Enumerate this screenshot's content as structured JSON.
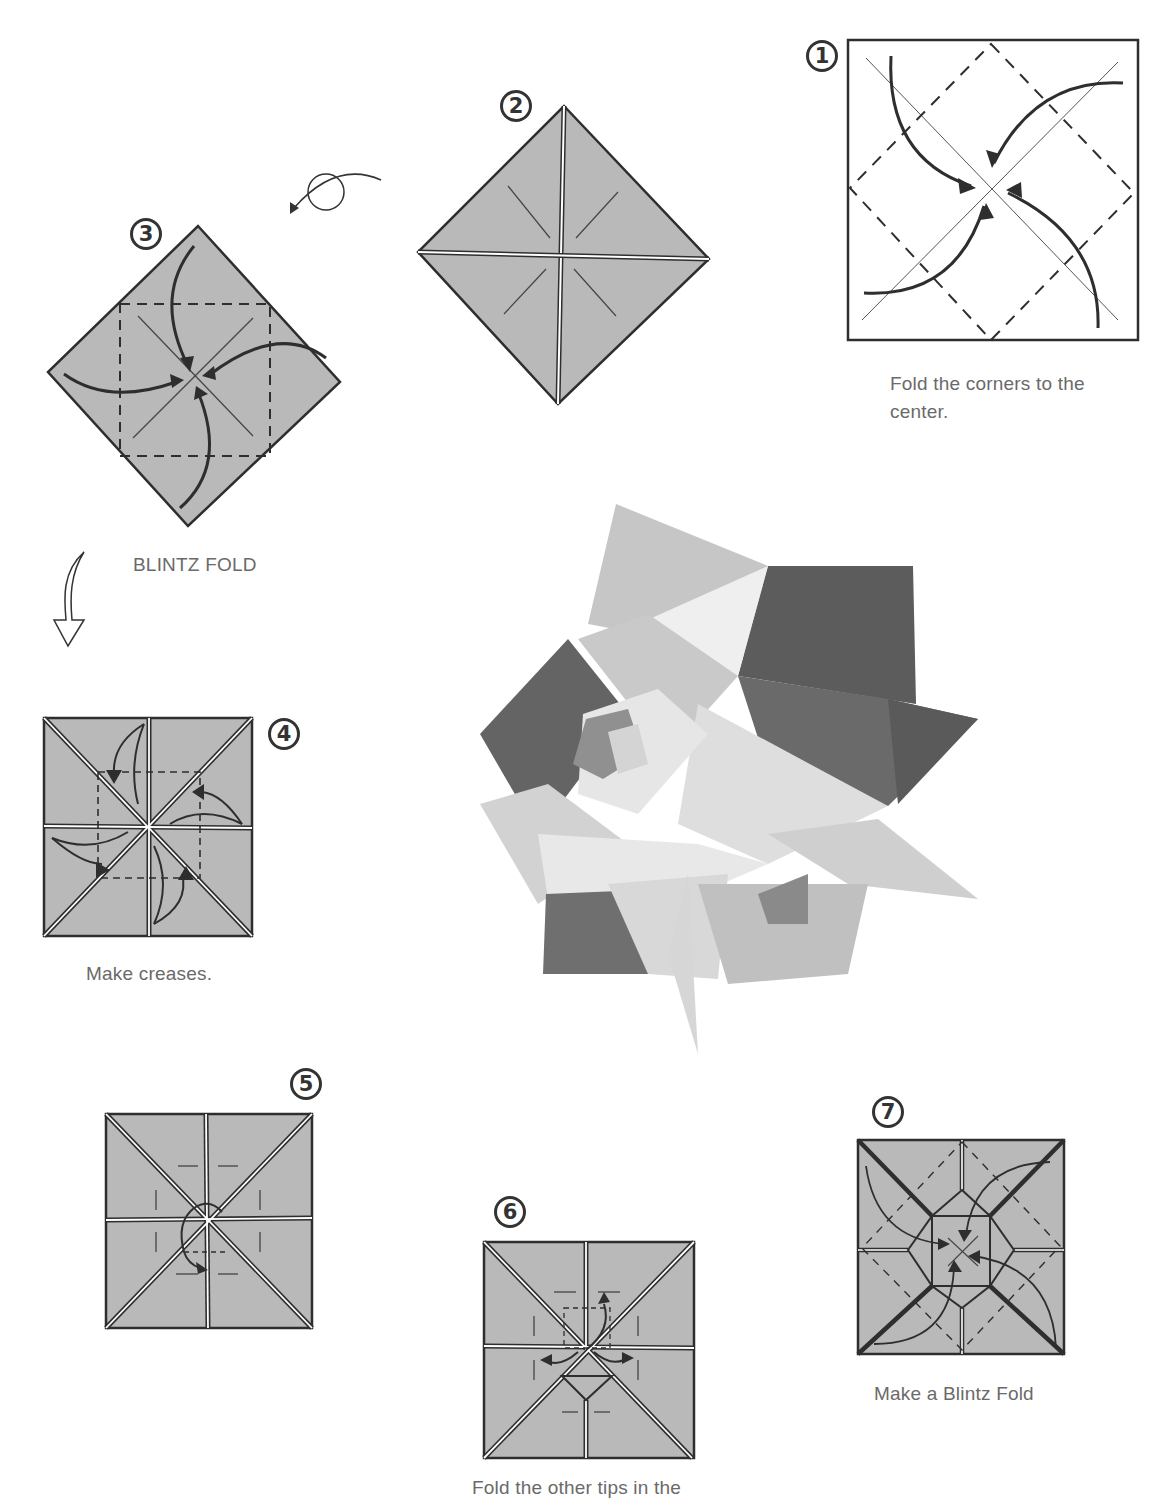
{
  "colors": {
    "paper_fill": "#b9b9b9",
    "line": "#2e2e2e",
    "caption_text": "#6a6a6a",
    "background": "#ffffff"
  },
  "steps": [
    {
      "number": "1",
      "caption": "Fold the corners to the center.",
      "caption_lines": [
        "Fold the corners to the",
        "center."
      ]
    },
    {
      "number": "2",
      "caption": ""
    },
    {
      "number": "3",
      "caption": "BLINTZ FOLD"
    },
    {
      "number": "4",
      "caption": "Make creases."
    },
    {
      "number": "5",
      "caption": ""
    },
    {
      "number": "6",
      "caption": "Fold the other tips in the"
    },
    {
      "number": "7",
      "caption": "Make a Blintz Fold"
    }
  ],
  "icons": {
    "turn_over": "turn-over-arrow-icon",
    "next_step": "hollow-down-arrow-icon"
  },
  "photo": {
    "subject": "finished origami modular star",
    "description": "Photograph of assembled origami modular polyhedron"
  }
}
